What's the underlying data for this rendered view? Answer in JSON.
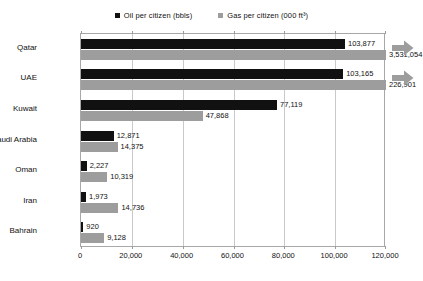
{
  "chart_data": {
    "type": "bar",
    "orientation": "horizontal",
    "title": "",
    "xlabel": "",
    "ylabel": "",
    "categories": [
      "Qatar",
      "UAE",
      "Kuwait",
      "Saudi Arabia",
      "Oman",
      "Iran",
      "Bahrain"
    ],
    "series": [
      {
        "name": "Oil per citizen (bbls)",
        "color": "#111111",
        "values": [
          103877,
          103165,
          77119,
          12871,
          2227,
          1973,
          920
        ],
        "labels": [
          "103,877",
          "103,165",
          "77,119",
          "12,871",
          "2,227",
          "1,973",
          "920"
        ]
      },
      {
        "name": "Gas per citizen (000 ft³)",
        "color": "#9d9d9d",
        "values": [
          3531054,
          226901,
          47868,
          14375,
          10319,
          14736,
          9128
        ],
        "labels": [
          "3,531,054",
          "226,901",
          "47,868",
          "14,375",
          "10,319",
          "14,736",
          "9,128"
        ]
      }
    ],
    "xlim": [
      0,
      120000
    ],
    "xticks": [
      0,
      20000,
      40000,
      60000,
      80000,
      100000,
      120000
    ],
    "xticklabels": [
      "0",
      "20,000",
      "40,000",
      "60,000",
      "80,000",
      "100,000",
      "120,000"
    ],
    "grid": true,
    "legend_position": "top-center",
    "overflow_markers": [
      {
        "category": "Qatar",
        "icon": "right-arrow-icon",
        "color": "#9d9d9d"
      },
      {
        "category": "UAE",
        "icon": "right-arrow-icon",
        "color": "#9d9d9d"
      }
    ]
  },
  "legend": {
    "items": [
      {
        "label": "Oil per citizen (bbls)",
        "color": "#111111",
        "icon": "legend-square-oil"
      },
      {
        "label": "Gas per citizen (000 ft³)",
        "color": "#9d9d9d",
        "icon": "legend-square-gas"
      }
    ]
  }
}
